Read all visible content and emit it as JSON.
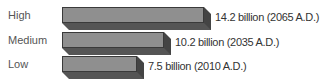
{
  "chart_data": {
    "type": "bar",
    "orientation": "horizontal",
    "style": "3d",
    "categories": [
      "High",
      "Medium",
      "Low"
    ],
    "values": [
      14.2,
      10.2,
      7.5
    ],
    "value_labels": [
      "14.2 billion (2065 A.D.)",
      "10.2 billion (2035 A.D.)",
      "7.5 billion (2010 A.D.)"
    ],
    "years": [
      2065,
      2035,
      2010
    ],
    "unit": "billion",
    "title": "",
    "xlabel": "",
    "ylabel": "",
    "grid": false,
    "legend": false
  },
  "colors": {
    "front": "#8f8f8f",
    "bottom": "#555555",
    "side": "#444444"
  }
}
